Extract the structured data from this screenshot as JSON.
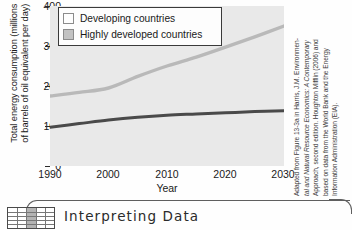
{
  "chart_data": {
    "type": "line",
    "title": "",
    "xlabel": "Year",
    "ylabel": "Total energy consumption (millions\nof barrels of oil equivalent per day)",
    "xlim": [
      1990,
      2030
    ],
    "ylim": [
      0,
      400
    ],
    "xticks": [
      "1990",
      "2000",
      "2010",
      "2020",
      "2030"
    ],
    "yticks": [
      "0",
      "100",
      "200",
      "300",
      "400"
    ],
    "grid": false,
    "legend_position": "top-center",
    "series": [
      {
        "name": "Developing countries",
        "color": "#b9b9b9",
        "swatch_color": "#fdfdfd",
        "x": [
          1990,
          1995,
          2000,
          2005,
          2010,
          2015,
          2020,
          2025,
          2030
        ],
        "values": [
          175,
          184,
          195,
          224,
          250,
          272,
          297,
          323,
          350
        ]
      },
      {
        "name": "Highly developed countries",
        "color": "#4a4a4a",
        "swatch_color": "#bfbfbf",
        "x": [
          1990,
          1995,
          2000,
          2005,
          2010,
          2015,
          2020,
          2025,
          2030
        ],
        "values": [
          97,
          106,
          115,
          122,
          127,
          130,
          133,
          136,
          138
        ]
      }
    ]
  },
  "legend": {
    "items": [
      {
        "label": "Developing countries"
      },
      {
        "label": "Highly developed countries"
      }
    ]
  },
  "credit": {
    "lines": [
      "Adapted from Figure 13-3a in Harris, J.M. Environmen-",
      "tal and Natural Resource Economics: A Contemporary",
      "Approach, second edition. Houghton Mifflin (2006) and",
      "based on data from the World Bank and the Energy",
      "Information Administration (EIA)."
    ]
  },
  "banner": {
    "title": "Interpreting Data",
    "icon": "table-grid-icon"
  }
}
